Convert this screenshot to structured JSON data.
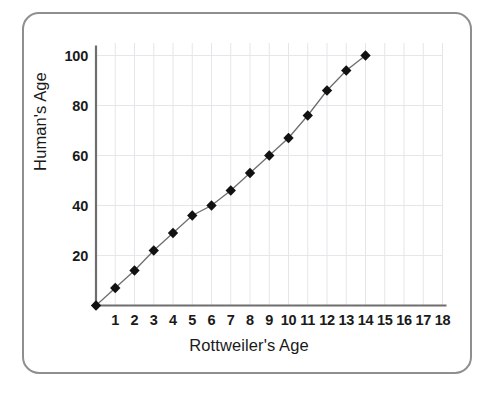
{
  "chart_data": {
    "type": "line",
    "title": "",
    "xlabel": "Rottweiler's Age",
    "ylabel": "Human's Age",
    "x": [
      0,
      1,
      2,
      3,
      4,
      5,
      6,
      7,
      8,
      9,
      10,
      11,
      12,
      13,
      14
    ],
    "values": [
      0,
      7,
      14,
      22,
      29,
      36,
      40,
      46,
      53,
      60,
      67,
      76,
      86,
      94,
      100
    ],
    "series": [
      {
        "name": "Rottweiler to human age",
        "x": [
          0,
          1,
          2,
          3,
          4,
          5,
          6,
          7,
          8,
          9,
          10,
          11,
          12,
          13,
          14
        ],
        "values": [
          0,
          7,
          14,
          22,
          29,
          36,
          40,
          46,
          53,
          60,
          67,
          76,
          86,
          94,
          100
        ],
        "marker": "diamond",
        "marker_color": "#111111",
        "line_color": "#6e6e6e"
      }
    ],
    "xlim": [
      0,
      18
    ],
    "ylim": [
      0,
      105
    ],
    "xticks": [
      1,
      2,
      3,
      4,
      5,
      6,
      7,
      8,
      9,
      10,
      11,
      12,
      13,
      14,
      15,
      16,
      17,
      18
    ],
    "yticks": [
      20,
      40,
      60,
      80,
      100
    ],
    "xtick_labels": [
      "1",
      "2",
      "3",
      "4",
      "5",
      "6",
      "7",
      "8",
      "9",
      "10",
      "11",
      "12",
      "13",
      "14",
      "15",
      "16",
      "17",
      "18"
    ],
    "ytick_labels": [
      "20",
      "40",
      "60",
      "80",
      "100"
    ],
    "grid": true,
    "grid_color": "#e6e6ea",
    "legend": false,
    "legend_position": "none"
  },
  "figure": {
    "border_color": "#8f8f8f",
    "background_color": "#ffffff",
    "axis_color": "#6e6e6e"
  }
}
